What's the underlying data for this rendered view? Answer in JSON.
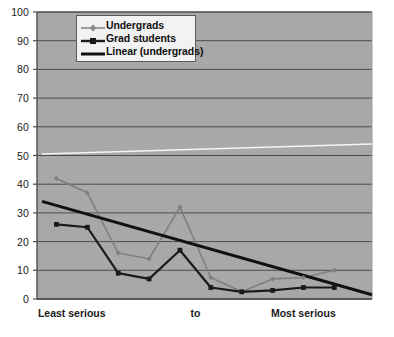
{
  "chart_data": {
    "type": "line",
    "title": "",
    "xlabel": "",
    "ylabel": "",
    "ylim": [
      0,
      100
    ],
    "ytick_step": 10,
    "yticks": [
      "0",
      "10",
      "20",
      "30",
      "40",
      "50",
      "60",
      "70",
      "80",
      "90",
      "100"
    ],
    "grid": "horizontal",
    "legend_position": "top-left inside plot",
    "categories": [
      "1",
      "2",
      "3",
      "4",
      "5",
      "6",
      "7",
      "8",
      "9",
      "10"
    ],
    "xtick_labels": [
      "Least serious",
      "to",
      "Most serious"
    ],
    "xtick_label_positions": [
      0.5,
      4.5,
      8.0
    ],
    "series": [
      {
        "name": "Undergrads",
        "style": "line-marker-diamond",
        "color": "#7f7f7f",
        "values": [
          42,
          37,
          16,
          14,
          32,
          7.5,
          2.5,
          7,
          7.5,
          10
        ]
      },
      {
        "name": "Grad students",
        "style": "line-marker-square",
        "color": "#1a1a1a",
        "values": [
          26,
          25,
          9,
          7,
          17,
          4,
          2.5,
          3,
          4,
          4
        ]
      },
      {
        "name": "Linear (undergrads)",
        "style": "trendline",
        "color": "#111111",
        "endpoints": [
          34,
          1.5
        ]
      },
      {
        "name": "Linear (grad students)",
        "style": "trendline-light",
        "color": "#f4f4f4",
        "endpoints": [
          50.5,
          54
        ]
      }
    ],
    "colors": {
      "plot_background": "#a8a8a8",
      "gridline": "#4d4d4d",
      "axis": "#4d4d4d",
      "undergrads": "#7f7f7f",
      "grad_students": "#1a1a1a",
      "trendline": "#111111",
      "trendline_light": "#f4f4f4",
      "legend_background": "#f2f2f2",
      "legend_border": "#5a5a5a",
      "text": "#1a1a1a"
    }
  },
  "legend": {
    "items": [
      {
        "label": "Undergrads",
        "icon": "line-diamond-marker-icon"
      },
      {
        "label": "Grad students",
        "icon": "line-square-marker-icon"
      },
      {
        "label": "Linear (undergrads)",
        "icon": "solid-line-icon"
      }
    ]
  }
}
